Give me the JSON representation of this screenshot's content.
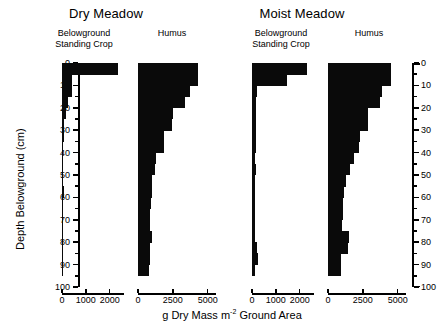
{
  "figure": {
    "axis_titles": {
      "y": "Depth Belowground (cm)",
      "x_prefix": "g Dry Mass m",
      "x_superscript": "-2",
      "x_suffix": " Ground Area"
    },
    "groups": [
      {
        "name": "Dry Meadow"
      },
      {
        "name": "Moist Meadow"
      }
    ]
  },
  "chart_data": {
    "type": "bar",
    "orientation": "horizontal",
    "title": "",
    "xlabel": "g Dry Mass m-2 Ground Area",
    "ylabel": "Depth Belowground (cm)",
    "ylim": [
      0,
      100
    ],
    "y_ticks_major": [
      0,
      10,
      20,
      30,
      40,
      50,
      60,
      70,
      80,
      90,
      100
    ],
    "y_tick_labels": [
      "0",
      "10",
      "20",
      "30",
      "40",
      "50",
      "60",
      "70",
      "80",
      "90",
      "100"
    ],
    "y_ticks_minor": [
      5,
      15,
      25,
      35,
      45,
      55,
      65,
      75,
      85,
      95
    ],
    "grid": false,
    "legend": "none",
    "depth_bins_cm": [
      [
        0,
        5
      ],
      [
        5,
        10
      ],
      [
        10,
        15
      ],
      [
        15,
        20
      ],
      [
        20,
        25
      ],
      [
        25,
        30
      ],
      [
        30,
        35
      ],
      [
        35,
        40
      ],
      [
        40,
        45
      ],
      [
        45,
        50
      ],
      [
        50,
        55
      ],
      [
        55,
        60
      ],
      [
        60,
        65
      ],
      [
        65,
        70
      ],
      [
        70,
        75
      ],
      [
        75,
        80
      ],
      [
        80,
        85
      ],
      [
        85,
        90
      ],
      [
        90,
        95
      ]
    ],
    "panels": [
      {
        "group": "Dry Meadow",
        "variable": "Belowground Standing Crop",
        "xlim": [
          0,
          2600
        ],
        "x_ticks": [
          0,
          1000,
          2000
        ],
        "x_tick_labels": [
          "0",
          "1000",
          "2000"
        ],
        "values": [
          2350,
          430,
          430,
          235,
          150,
          100,
          75,
          60,
          55,
          50,
          50,
          95,
          50,
          45,
          40,
          38,
          35,
          33,
          30
        ]
      },
      {
        "group": "Dry Meadow",
        "variable": "Humus",
        "xlim": [
          0,
          5600
        ],
        "x_ticks": [
          0,
          2500,
          5000
        ],
        "x_tick_labels": [
          "0",
          "2500",
          "5000"
        ],
        "values": [
          4300,
          4300,
          3700,
          3400,
          2500,
          2450,
          1900,
          1850,
          1300,
          1250,
          1000,
          980,
          900,
          880,
          860,
          1000,
          840,
          830,
          820
        ]
      },
      {
        "group": "Moist Meadow",
        "variable": "Belowground Standing Crop",
        "xlim": [
          0,
          2600
        ],
        "x_ticks": [
          0,
          1000,
          2000
        ],
        "x_tick_labels": [
          "0",
          "1000",
          "2000"
        ],
        "values": [
          2300,
          1450,
          230,
          170,
          160,
          170,
          150,
          155,
          140,
          150,
          130,
          135,
          120,
          120,
          115,
          120,
          230,
          235,
          110
        ]
      },
      {
        "group": "Moist Meadow",
        "variable": "Humus",
        "xlim": [
          0,
          5600
        ],
        "x_ticks": [
          0,
          2500,
          5000
        ],
        "x_tick_labels": [
          "0",
          "2500",
          "5000"
        ],
        "values": [
          4500,
          4500,
          3900,
          3750,
          2900,
          2850,
          2300,
          2250,
          1900,
          1550,
          1300,
          1150,
          1100,
          1050,
          1000,
          1500,
          1450,
          950,
          900
        ]
      }
    ]
  }
}
